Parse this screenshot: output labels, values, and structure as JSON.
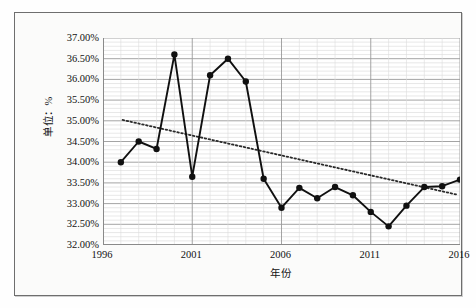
{
  "chart_data": {
    "type": "line",
    "title": "",
    "xlabel": "年份",
    "ylabel": "单位：%",
    "xlim": [
      1996,
      2016
    ],
    "ylim": [
      32.0,
      37.0
    ],
    "grid": true,
    "legend": "none",
    "ytick_labels": [
      "37.00%",
      "36.50%",
      "36.00%",
      "35.50%",
      "35.00%",
      "34.50%",
      "34.00%",
      "33.50%",
      "33.00%",
      "32.50%",
      "32.00%"
    ],
    "ytick_values": [
      37.0,
      36.5,
      36.0,
      35.5,
      35.0,
      34.5,
      34.0,
      33.5,
      33.0,
      32.5,
      32.0
    ],
    "xtick_labels": [
      "1996",
      "2001",
      "2006",
      "2011",
      "2016"
    ],
    "xtick_values": [
      1996,
      2001,
      2006,
      2011,
      2016
    ],
    "x": [
      1997,
      1998,
      1999,
      2000,
      2001,
      2002,
      2003,
      2004,
      2005,
      2006,
      2007,
      2008,
      2009,
      2010,
      2011,
      2012,
      2013,
      2014,
      2015,
      2016
    ],
    "series": [
      {
        "name": "比重",
        "style": "solid-line-with-round-markers",
        "color": "#101010",
        "values": [
          34.0,
          34.5,
          34.32,
          36.6,
          33.65,
          36.1,
          36.5,
          35.95,
          33.6,
          32.9,
          33.38,
          33.13,
          33.4,
          33.2,
          32.8,
          32.45,
          32.95,
          33.4,
          33.42,
          33.58
        ]
      },
      {
        "name": "趋势线",
        "style": "dotted-trendline",
        "color": "#2a2a2a",
        "endpoints": [
          {
            "x": 1997.1,
            "y": 35.02
          },
          {
            "x": 2015.8,
            "y": 33.22
          }
        ]
      }
    ]
  },
  "axes": {
    "y_title": "单位：%",
    "x_title": "年份"
  }
}
